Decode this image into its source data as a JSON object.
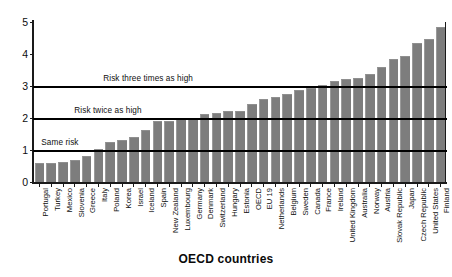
{
  "chart_data": {
    "type": "bar",
    "title": "",
    "xlabel": "OECD countries",
    "ylabel": "",
    "ylim": [
      0,
      5
    ],
    "yticks": [
      0,
      1,
      2,
      3,
      4,
      5
    ],
    "grid": false,
    "legend": "none",
    "bar_color": "#7d7d7d",
    "categories": [
      "Portugal",
      "Turkey",
      "Mexico",
      "Slovenia",
      "Greece",
      "Italy",
      "Poland",
      "Korea",
      "Israel",
      "Iceland",
      "Spain",
      "New Zealand",
      "Luxembourg",
      "Germany",
      "Denmark",
      "Switzerland",
      "Hungary",
      "Estonia",
      "OECD",
      "EU 19",
      "Netherlands",
      "Belgium",
      "Sweden",
      "Canada",
      "France",
      "Ireland",
      "United Kingdom",
      "Australia",
      "Norway",
      "Austria",
      "Slovak Republic",
      "Japan",
      "Czech Republic",
      "United States",
      "Finland"
    ],
    "values": [
      0.55,
      0.57,
      0.58,
      0.65,
      0.78,
      1.0,
      1.22,
      1.28,
      1.38,
      1.6,
      1.87,
      1.88,
      1.93,
      1.95,
      2.1,
      2.12,
      2.18,
      2.2,
      2.4,
      2.55,
      2.62,
      2.72,
      2.85,
      2.9,
      3.0,
      3.13,
      3.2,
      3.22,
      3.35,
      3.55,
      3.82,
      3.9,
      4.3,
      4.45,
      4.8
    ],
    "annotations": [
      {
        "label": "Risk three times as high",
        "y": 3,
        "label_x_pct": 17
      },
      {
        "label": "Risk twice as high",
        "y": 2,
        "label_x_pct": 10
      },
      {
        "label": "Same risk",
        "y": 1,
        "label_x_pct": 2
      }
    ]
  }
}
